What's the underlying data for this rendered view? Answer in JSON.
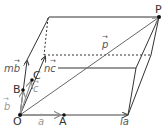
{
  "diagram": {
    "title": "",
    "points": {
      "O": "O",
      "A": "A",
      "B": "B",
      "C": "C",
      "P": "P"
    },
    "vectors": {
      "a": "a",
      "b": "b",
      "c": "c",
      "p": "p",
      "la": "la",
      "mb": "mb",
      "nc": "nc"
    },
    "arrow_glyph": "→",
    "colors": {
      "line": "#333333",
      "vector_gray": "#777777",
      "light_vector": "#aaaaaa",
      "point": "#111111"
    }
  }
}
